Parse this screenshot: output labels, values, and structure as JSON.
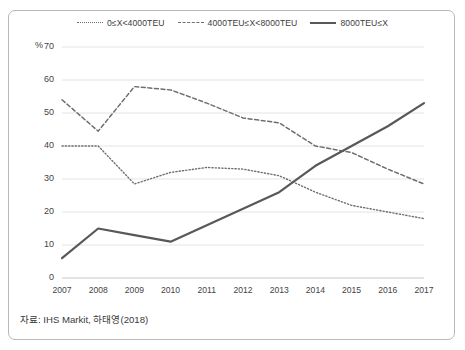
{
  "figure": {
    "y_axis_unit_label": "%",
    "source_note": "자료: IHS Markit, 하태영(2018)"
  },
  "legend": {
    "items": [
      {
        "label": "0≤X<4000TEU",
        "style": "dotted",
        "color": "#6e6e6e"
      },
      {
        "label": "4000TEU≤X<8000TEU",
        "style": "dashed",
        "color": "#6e6e6e"
      },
      {
        "label": "8000TEU≤X",
        "style": "solid",
        "color": "#585858"
      }
    ]
  },
  "axes": {
    "y_ticks": [
      "70",
      "60",
      "50",
      "40",
      "30",
      "20",
      "10",
      "0"
    ],
    "x_ticks": [
      "2007",
      "2008",
      "2009",
      "2010",
      "2011",
      "2012",
      "2013",
      "2014",
      "2015",
      "2016",
      "2017"
    ]
  },
  "chart_data": {
    "type": "line",
    "title": "",
    "xlabel": "",
    "ylabel": "%",
    "ylim": [
      0,
      70
    ],
    "grid": true,
    "legend_position": "top-center",
    "categories": [
      "2007",
      "2008",
      "2009",
      "2010",
      "2011",
      "2012",
      "2013",
      "2014",
      "2015",
      "2016",
      "2017"
    ],
    "series": [
      {
        "name": "0≤X<4000TEU",
        "style": "dotted",
        "color": "#6e6e6e",
        "values": [
          40,
          40,
          28.5,
          32,
          33.5,
          33,
          31,
          26,
          22,
          20,
          18
        ]
      },
      {
        "name": "4000TEU≤X<8000TEU",
        "style": "dashed",
        "color": "#6e6e6e",
        "values": [
          54,
          44.5,
          58,
          57,
          53,
          48.5,
          47,
          40,
          38,
          33,
          28.5
        ]
      },
      {
        "name": "8000TEU≤X",
        "style": "solid",
        "color": "#585858",
        "values": [
          6,
          15,
          13,
          11,
          16,
          21,
          26,
          34,
          40,
          46,
          53
        ]
      }
    ]
  }
}
